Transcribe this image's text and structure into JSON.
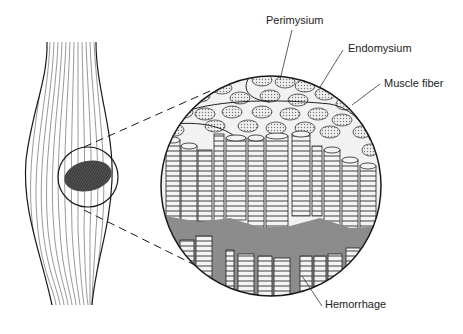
{
  "labels": {
    "perimysium": "Perimysium",
    "endomysium": "Endomysium",
    "muscle_fiber": "Muscle fiber",
    "hemorrhage": "Hemorrhage"
  },
  "colors": {
    "line": "#1a1a1a",
    "hemorrhage_fill": "#8c8c8c",
    "bruise_fill": "#4a4a4a",
    "fiber_fill": "#f4f4f4",
    "fiber_stripe": "#9a9a9a",
    "background": "#ffffff"
  }
}
